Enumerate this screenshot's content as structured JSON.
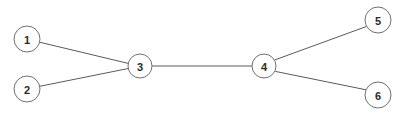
{
  "diagram": {
    "type": "undirected-graph",
    "title": "",
    "canvas": {
      "width": 408,
      "height": 118,
      "background": "#ffffff"
    },
    "style": {
      "node_fill": "#ffffff",
      "node_stroke": "#707070",
      "edge_stroke": "#5a5a5a",
      "label_color": "#2b2b2b"
    },
    "nodes": [
      {
        "id": "1",
        "label": "1",
        "cx": 27,
        "cy": 39,
        "r": 13
      },
      {
        "id": "2",
        "label": "2",
        "cx": 27,
        "cy": 89,
        "r": 13
      },
      {
        "id": "3",
        "label": "3",
        "cx": 140,
        "cy": 66,
        "r": 12
      },
      {
        "id": "4",
        "label": "4",
        "cx": 264,
        "cy": 66,
        "r": 12
      },
      {
        "id": "5",
        "label": "5",
        "cx": 378,
        "cy": 20,
        "r": 13
      },
      {
        "id": "6",
        "label": "6",
        "cx": 378,
        "cy": 95,
        "r": 13
      }
    ],
    "edges": [
      {
        "id": "e1",
        "from": "1",
        "to": "3",
        "x1": 39.6,
        "y1": 42.2,
        "x2": 128.2,
        "y2": 63.4
      },
      {
        "id": "e2",
        "from": "2",
        "to": "3",
        "x1": 39.7,
        "y1": 86.3,
        "x2": 128.3,
        "y2": 68.5
      },
      {
        "id": "e3",
        "from": "3",
        "to": "4",
        "x1": 152.0,
        "y1": 66.0,
        "x2": 252.0,
        "y2": 66.0
      },
      {
        "id": "e4",
        "from": "4",
        "to": "5",
        "x1": 274.6,
        "y1": 60.0,
        "x2": 366.4,
        "y2": 26.5
      },
      {
        "id": "e5",
        "from": "4",
        "to": "6",
        "x1": 275.3,
        "y1": 71.4,
        "x2": 366.1,
        "y2": 89.8
      }
    ]
  }
}
